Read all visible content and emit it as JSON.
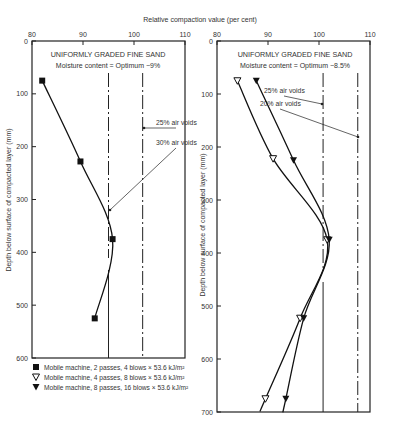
{
  "figure": {
    "x_axis_title": "Relative compaction value (per cent)",
    "y_axis_title": "Depth below surface of compacted layer (mm)"
  },
  "legend": [
    {
      "marker": "filled-square",
      "label": "Mobile machine, 2 passes, 4 blows × 53.6 kJ/m²"
    },
    {
      "marker": "hollow-triangle-down",
      "label": "Mobile machine, 4 passes, 8 blows × 53.6 kJ/m²"
    },
    {
      "marker": "filled-triangle-down",
      "label": "Mobile machine, 8 passes, 16 blows × 53.6 kJ/m²"
    }
  ],
  "chart_data": [
    {
      "type": "line",
      "title": "UNIFORMLY GRADED FINE SAND",
      "subtitle": "Moisture content = Optimum −9%",
      "xlabel": "Relative compaction value (per cent)",
      "ylabel": "Depth below surface of compacted layer (mm)",
      "xlim": [
        80,
        110
      ],
      "ylim": [
        0,
        600
      ],
      "x_ticks": [
        80,
        90,
        100,
        110
      ],
      "y_ticks": [
        0,
        100,
        200,
        300,
        400,
        500,
        600
      ],
      "x_axis_position": "top",
      "y_inverted": true,
      "grid": false,
      "series": [
        {
          "name": "Mobile machine, 2 passes, 4 blows × 53.6 kJ/m²",
          "marker": "filled-square",
          "points": [
            [
              82,
              75
            ],
            [
              89.5,
              228
            ],
            [
              95.8,
              375
            ],
            [
              92.3,
              525
            ]
          ]
        }
      ],
      "reference_lines": [
        {
          "label": "30% air voids",
          "x": 95,
          "style": "dash-dot-then-solid"
        },
        {
          "label": "25% air voids",
          "x": 101.7,
          "style": "dash-dot"
        }
      ],
      "annotations": [
        "25% air voids",
        "30% air voids"
      ]
    },
    {
      "type": "line",
      "title": "UNIFORMLY GRADED FINE SAND",
      "subtitle": "Moisture content = Optimum −8.5%",
      "xlabel": "Relative compaction value (per cent)",
      "ylabel": "Depth below surface of compacted layer (mm)",
      "xlim": [
        80,
        110
      ],
      "ylim": [
        0,
        700
      ],
      "x_ticks": [
        80,
        90,
        100,
        110
      ],
      "y_ticks": [
        0,
        100,
        200,
        300,
        400,
        500,
        600,
        700
      ],
      "x_axis_position": "top",
      "y_inverted": true,
      "grid": false,
      "series": [
        {
          "name": "Mobile machine, 4 passes, 8 blows × 53.6 kJ/m²",
          "marker": "hollow-triangle-down",
          "points": [
            [
              84,
              75
            ],
            [
              91,
              222
            ],
            [
              101.6,
              375
            ],
            [
              96.3,
              523
            ],
            [
              89.5,
              675
            ]
          ]
        },
        {
          "name": "Mobile machine, 8 passes, 16 blows × 53.6 kJ/m²",
          "marker": "filled-triangle-down",
          "points": [
            [
              87.7,
              75
            ],
            [
              95,
              225
            ],
            [
              102,
              375
            ],
            [
              97,
              523
            ],
            [
              93.5,
              675
            ]
          ]
        }
      ],
      "reference_lines": [
        {
          "label": "25% air voids",
          "x": 100.8,
          "style": "dash-dot-then-solid"
        },
        {
          "label": "20% air voids",
          "x": 107.6,
          "style": "dash-dot"
        }
      ],
      "annotations": [
        "25% air voids",
        "20% air voids"
      ]
    }
  ]
}
